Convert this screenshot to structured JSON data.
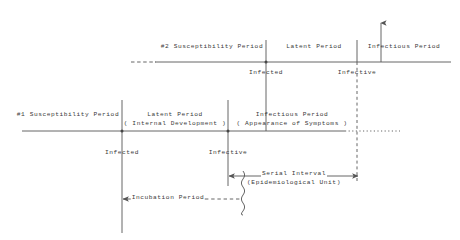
{
  "figure": {
    "type": "timeline-diagram",
    "title": "",
    "background_color": "#ffffff",
    "line_color": "#555555",
    "text_color": "#3a3a3a"
  },
  "timelines": {
    "secondary": {
      "name": "#2 generation timeline",
      "y": 62,
      "x_start": 131,
      "x_end": 451,
      "dashed_from": 131,
      "dashed_to": 156,
      "segments": [
        {
          "label": "#2 Susceptibility Period",
          "label_x": 212,
          "label_y": 47,
          "x_from": 131,
          "x_to": 266
        },
        {
          "label": "Latent Period",
          "label_x": 314,
          "label_y": 47,
          "x_from": 266,
          "x_to": 357
        },
        {
          "label": "Infectious Period",
          "label_x": 404,
          "label_y": 47,
          "x_from": 357,
          "x_to": 451
        }
      ],
      "events": [
        {
          "label": "Infected",
          "x": 266,
          "y_label": 73
        },
        {
          "label": "Infective",
          "x": 357,
          "y_label": 73
        }
      ]
    },
    "primary": {
      "name": "#1 generation timeline",
      "y": 131,
      "x_start": 22,
      "x_end": 400,
      "dotted_from": 345,
      "dotted_to": 400,
      "segments": [
        {
          "label": "#1 Susceptibility Period",
          "label_x": 68,
          "label_y": 115,
          "x_from": 22,
          "x_to": 122
        },
        {
          "label": "Latent Period",
          "sublabel": "( Internal Development )",
          "label_x": 175,
          "label_y": 115,
          "x_from": 122,
          "x_to": 228
        },
        {
          "label": "Infectious Period",
          "sublabel": "( Appearance of Symptoms )",
          "label_x": 292,
          "label_y": 115,
          "x_from": 228,
          "x_to": 345
        }
      ],
      "events": [
        {
          "label": "Infected",
          "x": 122,
          "y_label": 153
        },
        {
          "label": "Infective",
          "x": 228,
          "y_label": 153
        }
      ]
    }
  },
  "measures": [
    {
      "name": "serial-interval",
      "label": "Serial Interval",
      "sublabel": "(Epidemiological Unit)",
      "x_from": 229,
      "x_to": 358,
      "y": 176,
      "arrow": "double",
      "label_x": 294,
      "label_y": 171
    },
    {
      "name": "incubation-period",
      "label": "Incubation Period",
      "x_from": 123,
      "x_to": 243,
      "y": 199,
      "arrow": "left",
      "dashed_from": 205,
      "dashed_to": 243,
      "label_x": 168,
      "label_y": 195
    }
  ],
  "connectors": [
    {
      "name": "infected-link",
      "x": 266,
      "y_from": 62,
      "y_to": 131,
      "style": "solid"
    },
    {
      "name": "infective-link",
      "x": 357,
      "y_from": 62,
      "y_to": 180,
      "style": "dashed"
    },
    {
      "name": "infectious-up-arrow",
      "x": 381,
      "y_from": 62,
      "y_to": 22,
      "style": "arrow-up"
    },
    {
      "name": "infected-tick-primary",
      "x": 122,
      "y_from": 100,
      "y_to": 233,
      "style": "solid"
    },
    {
      "name": "infective-tick-primary",
      "x": 228,
      "y_from": 100,
      "y_to": 186,
      "style": "solid"
    },
    {
      "name": "squiggle-marker",
      "x": 243,
      "y_from": 171,
      "y_to": 215,
      "style": "wavy"
    }
  ]
}
